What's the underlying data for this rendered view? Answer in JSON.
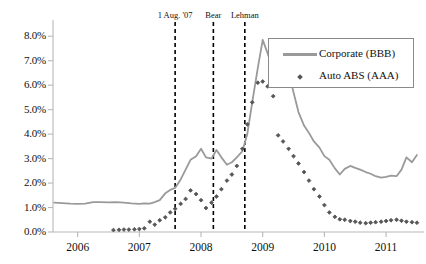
{
  "chart_data": {
    "type": "line",
    "title": "",
    "subtitle": "",
    "xlabel": "",
    "ylabel": "",
    "xlim": [
      2005.6,
      2011.55
    ],
    "ylim": [
      0.0,
      8.5
    ],
    "grid": false,
    "legend_position": "top-right",
    "x_tick_labels": [
      "2006",
      "2007",
      "2008",
      "2009",
      "2010",
      "2011"
    ],
    "x_tick_values": [
      2006,
      2007,
      2008,
      2009,
      2010,
      2011
    ],
    "y_tick_labels": [
      "0.0%",
      "1.0%",
      "2.0%",
      "3.0%",
      "4.0%",
      "5.0%",
      "6.0%",
      "7.0%",
      "8.0%"
    ],
    "y_tick_values": [
      0,
      1,
      2,
      3,
      4,
      5,
      6,
      7,
      8
    ],
    "annotations": [
      {
        "label": "1 Aug. '07",
        "x": 2007.58,
        "style": "dashed-vline"
      },
      {
        "label": "Bear",
        "x": 2008.2,
        "style": "dashed-vline"
      },
      {
        "label": "Lehman",
        "x": 2008.71,
        "style": "dashed-vline"
      }
    ],
    "series": [
      {
        "name": "Corporate (BBB)",
        "color": "#9a9a9a",
        "marker": "none",
        "style": "line",
        "x": [
          2005.62,
          2005.75,
          2005.88,
          2006.0,
          2006.12,
          2006.25,
          2006.37,
          2006.5,
          2006.62,
          2006.75,
          2006.87,
          2007.0,
          2007.08,
          2007.17,
          2007.25,
          2007.33,
          2007.42,
          2007.5,
          2007.58,
          2007.67,
          2007.75,
          2007.83,
          2007.92,
          2008.0,
          2008.08,
          2008.17,
          2008.25,
          2008.33,
          2008.42,
          2008.5,
          2008.58,
          2008.67,
          2008.75,
          2008.83,
          2008.92,
          2009.0,
          2009.08,
          2009.17,
          2009.25,
          2009.33,
          2009.42,
          2009.5,
          2009.58,
          2009.67,
          2009.75,
          2009.83,
          2009.92,
          2010.0,
          2010.08,
          2010.17,
          2010.25,
          2010.33,
          2010.42,
          2010.5,
          2010.58,
          2010.67,
          2010.75,
          2010.83,
          2010.92,
          2011.0,
          2011.08,
          2011.17,
          2011.25,
          2011.33,
          2011.42,
          2011.5
        ],
        "values": [
          1.2,
          1.18,
          1.16,
          1.15,
          1.16,
          1.22,
          1.22,
          1.21,
          1.22,
          1.2,
          1.17,
          1.15,
          1.17,
          1.16,
          1.22,
          1.3,
          1.58,
          1.72,
          1.8,
          2.15,
          2.55,
          2.95,
          3.1,
          3.4,
          3.05,
          3.0,
          3.35,
          3.05,
          2.75,
          2.85,
          3.05,
          3.3,
          4.0,
          5.3,
          6.7,
          7.85,
          7.3,
          6.6,
          7.1,
          7.05,
          6.55,
          5.7,
          4.9,
          4.35,
          4.05,
          3.7,
          3.45,
          3.1,
          2.95,
          2.6,
          2.35,
          2.58,
          2.7,
          2.62,
          2.55,
          2.45,
          2.38,
          2.28,
          2.22,
          2.25,
          2.3,
          2.28,
          2.55,
          3.05,
          2.85,
          3.15
        ]
      },
      {
        "name": "Auto ABS (AAA)",
        "color": "#565656",
        "marker": "diamond",
        "style": "markers",
        "x": [
          2006.58,
          2006.67,
          2006.75,
          2006.83,
          2006.92,
          2007.0,
          2007.08,
          2007.17,
          2007.25,
          2007.33,
          2007.42,
          2007.5,
          2007.58,
          2007.67,
          2007.75,
          2007.83,
          2007.92,
          2008.0,
          2008.08,
          2008.17,
          2008.25,
          2008.33,
          2008.42,
          2008.5,
          2008.58,
          2008.67,
          2008.75,
          2008.83,
          2008.92,
          2009.0,
          2009.08,
          2009.17,
          2009.25,
          2009.33,
          2009.42,
          2009.5,
          2009.58,
          2009.67,
          2009.75,
          2009.83,
          2009.92,
          2010.0,
          2010.08,
          2010.17,
          2010.25,
          2010.33,
          2010.42,
          2010.5,
          2010.58,
          2010.67,
          2010.75,
          2010.83,
          2010.92,
          2011.0,
          2011.08,
          2011.17,
          2011.25,
          2011.33,
          2011.42,
          2011.5
        ],
        "values": [
          0.08,
          0.09,
          0.1,
          0.1,
          0.11,
          0.12,
          0.15,
          0.42,
          0.3,
          0.48,
          0.6,
          0.8,
          0.95,
          1.15,
          1.35,
          1.7,
          1.55,
          1.3,
          0.98,
          1.2,
          1.45,
          1.75,
          2.1,
          2.35,
          2.7,
          3.4,
          4.4,
          5.3,
          6.1,
          6.15,
          5.95,
          5.55,
          3.95,
          3.7,
          3.4,
          3.1,
          2.8,
          2.45,
          2.1,
          1.75,
          1.45,
          1.1,
          0.8,
          0.62,
          0.52,
          0.5,
          0.45,
          0.42,
          0.38,
          0.36,
          0.38,
          0.4,
          0.42,
          0.45,
          0.48,
          0.5,
          0.46,
          0.42,
          0.4,
          0.38
        ]
      }
    ]
  },
  "legend": {
    "items": [
      {
        "label": "Corporate (BBB)",
        "type": "line",
        "color": "#9a9a9a"
      },
      {
        "label": "Auto ABS (AAA)",
        "type": "marker",
        "color": "#565656"
      }
    ]
  },
  "colors": {
    "corporate": "#9a9a9a",
    "auto_abs": "#565656",
    "axis": "#b8b8b8",
    "annotation": "#000000",
    "background": "#ffffff"
  }
}
